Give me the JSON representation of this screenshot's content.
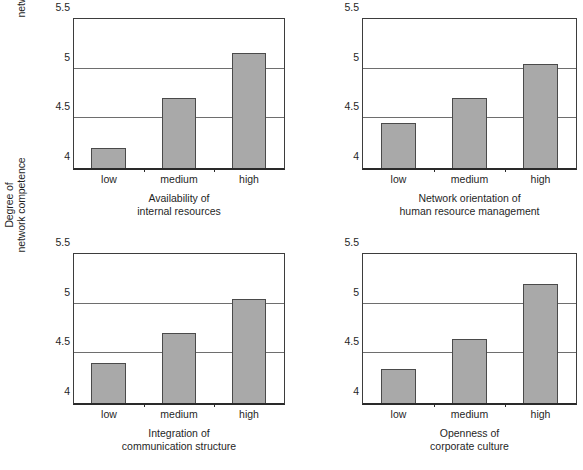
{
  "figure": {
    "y_axis_title_line1": "Degree of",
    "y_axis_title_line2": "network competence",
    "categories": [
      "low",
      "medium",
      "high"
    ],
    "y_ticks": [
      "4",
      "4.5",
      "5",
      "5.5"
    ],
    "bar_color": "#a9a9a9",
    "bar_border_color": "#4a4a4a",
    "gridline_color": "#6e6e6e",
    "axis_color": "#2a2a2a"
  },
  "panels": [
    {
      "caption_line1": "Availability of",
      "caption_line2": "internal resources",
      "has_y_axis_title": true
    },
    {
      "caption_line1": "Network orientation of",
      "caption_line2": "human resource management",
      "has_y_axis_title": false
    },
    {
      "caption_line1": "Integration of",
      "caption_line2": "communication structure",
      "has_y_axis_title": true
    },
    {
      "caption_line1": "Openness of",
      "caption_line2": "corporate culture",
      "has_y_axis_title": false
    }
  ],
  "chart_data": [
    {
      "type": "bar",
      "title": "Availability of internal resources",
      "categories": [
        "low",
        "medium",
        "high"
      ],
      "values": [
        4.2,
        4.7,
        5.16
      ],
      "xlabel": "Availability of internal resources",
      "ylabel": "Degree of network competence",
      "ylim": [
        4,
        5.5
      ],
      "yticks": [
        4,
        4.5,
        5,
        5.5
      ],
      "grid": true,
      "legend": "none"
    },
    {
      "type": "bar",
      "title": "Network orientation of human resource management",
      "categories": [
        "low",
        "medium",
        "high"
      ],
      "values": [
        4.45,
        4.7,
        5.05
      ],
      "xlabel": "Network orientation of human resource management",
      "ylabel": "Degree of network competence",
      "ylim": [
        4,
        5.5
      ],
      "yticks": [
        4,
        4.5,
        5,
        5.5
      ],
      "grid": true,
      "legend": "none"
    },
    {
      "type": "bar",
      "title": "Integration of communication structure",
      "categories": [
        "low",
        "medium",
        "high"
      ],
      "values": [
        4.4,
        4.7,
        5.05
      ],
      "xlabel": "Integration of communication structure",
      "ylabel": "Degree of network competence",
      "ylim": [
        4,
        5.5
      ],
      "yticks": [
        4,
        4.5,
        5,
        5.5
      ],
      "grid": true,
      "legend": "none"
    },
    {
      "type": "bar",
      "title": "Openness of corporate culture",
      "categories": [
        "low",
        "medium",
        "high"
      ],
      "values": [
        4.34,
        4.64,
        5.2
      ],
      "xlabel": "Openness of corporate culture",
      "ylabel": "Degree of network competence",
      "ylim": [
        4,
        5.5
      ],
      "yticks": [
        4,
        4.5,
        5,
        5.5
      ],
      "grid": true,
      "legend": "none"
    }
  ]
}
